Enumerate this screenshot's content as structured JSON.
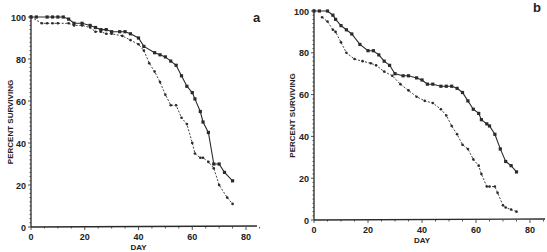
{
  "chart_data": [
    {
      "type": "line",
      "panel_label": "a",
      "title": "",
      "xlabel": "DAY",
      "ylabel": "PERCENT  SURVIVING",
      "xlim": [
        0,
        85
      ],
      "ylim": [
        0,
        100
      ],
      "xticks": [
        0,
        20,
        40,
        60,
        80
      ],
      "yticks": [
        0,
        20,
        40,
        60,
        80,
        100
      ],
      "grid": false,
      "legend": "none",
      "series": [
        {
          "name": "solid",
          "style": "solid",
          "x": [
            0,
            2,
            6,
            8,
            10,
            12,
            14,
            16,
            19,
            22,
            24,
            26,
            28,
            30,
            33,
            35,
            37,
            40,
            42,
            46,
            48,
            50,
            52,
            54,
            56,
            58,
            60,
            61,
            63,
            64,
            66,
            68,
            70,
            72,
            75
          ],
          "y": [
            100,
            100,
            100,
            100,
            100,
            100,
            99,
            97,
            97,
            96,
            95,
            94,
            94,
            93,
            93,
            93,
            92,
            90,
            86,
            83,
            82,
            81,
            79,
            77,
            72,
            67,
            64,
            61,
            55,
            50,
            45,
            30,
            30,
            26,
            22
          ]
        },
        {
          "name": "dashed",
          "style": "dashed",
          "x": [
            0,
            4,
            6,
            8,
            10,
            14,
            16,
            19,
            22,
            24,
            26,
            28,
            30,
            34,
            37,
            40,
            42,
            44,
            46,
            48,
            50,
            52,
            54,
            56,
            58,
            60,
            61,
            63,
            64,
            66,
            68,
            70,
            73,
            75
          ],
          "y": [
            100,
            97,
            97,
            97,
            97,
            97,
            96,
            96,
            95,
            93,
            93,
            92,
            92,
            91,
            89,
            87,
            84,
            78,
            74,
            69,
            63,
            58,
            58,
            52,
            49,
            40,
            35,
            33,
            33,
            31,
            28,
            20,
            14,
            11
          ]
        }
      ]
    },
    {
      "type": "line",
      "panel_label": "b",
      "title": "",
      "xlabel": "DAY",
      "ylabel": "PERCENT  SURVIVING",
      "xlim": [
        0,
        85
      ],
      "ylim": [
        0,
        100
      ],
      "xticks": [
        0,
        20,
        40,
        60,
        80
      ],
      "yticks": [
        0,
        20,
        40,
        60,
        80,
        100
      ],
      "grid": false,
      "legend": "none",
      "series": [
        {
          "name": "solid",
          "style": "solid",
          "x": [
            0,
            2,
            5,
            7,
            8,
            10,
            12,
            14,
            17,
            20,
            22,
            24,
            26,
            28,
            30,
            33,
            35,
            38,
            40,
            42,
            44,
            47,
            49,
            51,
            53,
            55,
            57,
            59,
            61,
            62,
            64,
            65,
            67,
            69,
            71,
            73,
            75
          ],
          "y": [
            100,
            100,
            100,
            98,
            96,
            93,
            91,
            89,
            84,
            81,
            81,
            79,
            76,
            74,
            70,
            69,
            69,
            68,
            67,
            65,
            65,
            64,
            64,
            64,
            63,
            61,
            57,
            53,
            51,
            48,
            46,
            45,
            41,
            34,
            28,
            26,
            23
          ]
        },
        {
          "name": "dashed",
          "style": "dashed",
          "x": [
            3,
            5,
            7,
            8,
            10,
            12,
            15,
            18,
            21,
            23,
            26,
            29,
            32,
            35,
            38,
            41,
            44,
            47,
            49,
            51,
            53,
            55,
            57,
            59,
            61,
            62,
            64,
            65,
            67,
            68,
            70,
            71,
            73,
            75
          ],
          "y": [
            97,
            95,
            91,
            90,
            85,
            80,
            77,
            76,
            75,
            74,
            71,
            69,
            65,
            62,
            59,
            57,
            56,
            53,
            50,
            45,
            41,
            36,
            34,
            29,
            26,
            22,
            16,
            16,
            16,
            13,
            7,
            6,
            5,
            4
          ]
        }
      ]
    }
  ]
}
